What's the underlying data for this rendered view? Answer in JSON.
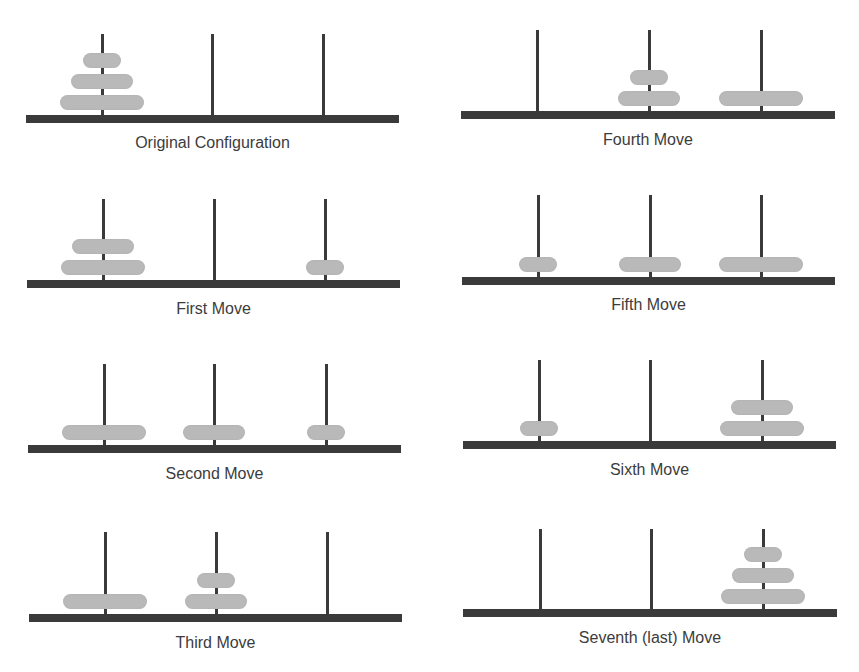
{
  "colors": {
    "base": "#3a3a3a",
    "peg": "#3a3a3a",
    "disk": "#b9b9b9",
    "label": "#3c3c3c"
  },
  "disk_sizes": {
    "small": 38,
    "medium": 62,
    "large": 84
  },
  "panels": [
    {
      "label": "Original Configuration",
      "base": {
        "x": 26,
        "y": 115,
        "w": 373
      },
      "pegs": [
        102,
        212,
        323
      ],
      "peg_top": 34,
      "label_y": 134,
      "stacks": [
        [
          "large",
          "medium",
          "small"
        ],
        [],
        []
      ]
    },
    {
      "label": "First Move",
      "base": {
        "x": 27,
        "y": 280,
        "w": 373
      },
      "pegs": [
        103,
        214,
        325
      ],
      "peg_top": 199,
      "label_y": 300,
      "stacks": [
        [
          "large",
          "medium"
        ],
        [],
        [
          "small"
        ]
      ]
    },
    {
      "label": "Second Move",
      "base": {
        "x": 28,
        "y": 445,
        "w": 373
      },
      "pegs": [
        104,
        214,
        326
      ],
      "peg_top": 364,
      "label_y": 465,
      "stacks": [
        [
          "large"
        ],
        [
          "medium"
        ],
        [
          "small"
        ]
      ]
    },
    {
      "label": "Third Move",
      "base": {
        "x": 29,
        "y": 614,
        "w": 373
      },
      "pegs": [
        105,
        216,
        327
      ],
      "peg_top": 532,
      "label_y": 634,
      "stacks": [
        [
          "large"
        ],
        [
          "medium",
          "small"
        ],
        []
      ]
    },
    {
      "label": "Fourth Move",
      "base": {
        "x": 461,
        "y": 111,
        "w": 374
      },
      "pegs": [
        537,
        649,
        761
      ],
      "peg_top": 30,
      "label_y": 131,
      "stacks": [
        [],
        [
          "medium",
          "small"
        ],
        [
          "large"
        ]
      ]
    },
    {
      "label": "Fifth Move",
      "base": {
        "x": 462,
        "y": 277,
        "w": 373
      },
      "pegs": [
        538,
        650,
        761
      ],
      "peg_top": 195,
      "label_y": 296,
      "stacks": [
        [
          "small"
        ],
        [
          "medium"
        ],
        [
          "large"
        ]
      ]
    },
    {
      "label": "Sixth Move",
      "base": {
        "x": 463,
        "y": 441,
        "w": 373
      },
      "pegs": [
        539,
        650,
        762
      ],
      "peg_top": 360,
      "label_y": 461,
      "stacks": [
        [
          "small"
        ],
        [],
        [
          "large",
          "medium"
        ]
      ]
    },
    {
      "label": "Seventh (last) Move",
      "base": {
        "x": 463,
        "y": 609,
        "w": 374
      },
      "pegs": [
        540,
        651,
        763
      ],
      "peg_top": 529,
      "label_y": 629,
      "stacks": [
        [],
        [],
        [
          "large",
          "medium",
          "small"
        ]
      ]
    }
  ]
}
